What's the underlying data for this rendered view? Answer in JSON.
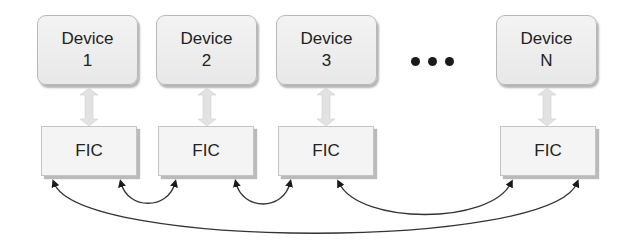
{
  "diagram": {
    "devices": [
      {
        "name": "Device",
        "index": "1"
      },
      {
        "name": "Device",
        "index": "2"
      },
      {
        "name": "Device",
        "index": "3"
      },
      {
        "name": "Device",
        "index": "N"
      }
    ],
    "fics": [
      {
        "label": "FIC"
      },
      {
        "label": "FIC"
      },
      {
        "label": "FIC"
      },
      {
        "label": "FIC"
      }
    ],
    "ellipsis": "•••",
    "connections": [
      {
        "from": "FIC 1",
        "to": "FIC 2",
        "type": "bidirectional"
      },
      {
        "from": "FIC 2",
        "to": "FIC 3",
        "type": "bidirectional"
      },
      {
        "from": "FIC 3",
        "to": "FIC N",
        "type": "bidirectional"
      },
      {
        "from": "FIC 1",
        "to": "FIC N",
        "type": "bidirectional"
      }
    ],
    "device_fic_links": "bidirectional (device ↔ FIC)",
    "colors": {
      "box_fill": "#f0f0f0",
      "box_border": "#b8b8b8",
      "shadow": "#8c8c8c",
      "arc": "#222222",
      "text": "#222222"
    }
  }
}
